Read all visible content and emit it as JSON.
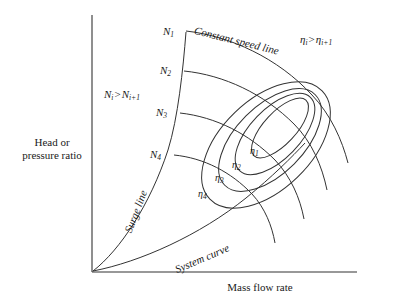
{
  "figure": {
    "type": "performance-map",
    "background_color": "#ffffff",
    "stroke_color": "#333333",
    "text_color": "#1a1a1a"
  },
  "axes": {
    "y_label_line1": "Head or",
    "y_label_line2": "pressure ratio",
    "x_label": "Mass flow rate"
  },
  "speed_lines": {
    "labels": [
      "N",
      "N",
      "N",
      "N"
    ],
    "subscripts": [
      "1",
      "2",
      "3",
      "4"
    ],
    "count": 4
  },
  "efficiency_contours": {
    "labels": [
      "η",
      "η",
      "η",
      "η"
    ],
    "subscripts": [
      "1",
      "2",
      "3",
      "4"
    ],
    "count": 4
  },
  "annotations": {
    "constant_speed_line": "Constant speed line",
    "surge_line": "Surge line",
    "system_curve": "System curve",
    "speed_order_symbol": "N",
    "speed_order_sub_left": "i",
    "speed_order_gt": ">",
    "speed_order_sub_right": "i+1",
    "eff_order_symbol": "η",
    "eff_order_sub_left": "i",
    "eff_order_gt": ">",
    "eff_order_sub_right": "i+1"
  }
}
